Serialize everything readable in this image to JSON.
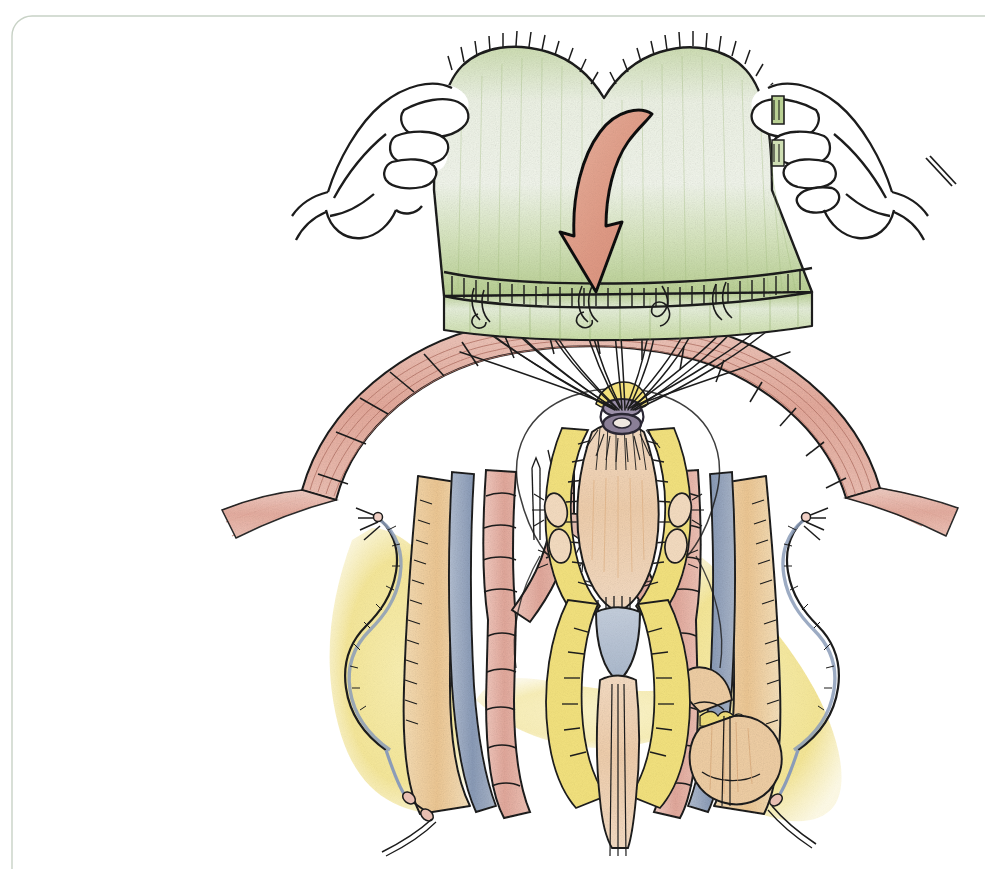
{
  "figure": {
    "domain": "Diagram",
    "kind": "hand-drawn medical surgical illustration",
    "title": "",
    "caption": "",
    "labels": [],
    "has_text": false,
    "background_color": "#ffffff",
    "canvas": {
      "width": 985,
      "height": 869
    }
  },
  "frame": {
    "style": "thin rounded-corner hairline border along top and left edges",
    "color": "#c8d2c6",
    "corner_radius": 26,
    "stroke_width": 1.4
  },
  "palette": {
    "ink": "#1a1a1a",
    "graft_green_light": "#eef3e4",
    "graft_green_mid": "#cfdfb4",
    "graft_green_deep": "#a9c383",
    "arrow_salmon": "#e09b86",
    "arrow_salmon_light": "#eab4a0",
    "artery_pink": "#e8b3a8",
    "artery_pink_deep": "#d9968a",
    "vein_blue": "#9aa9c2",
    "vein_blue_deep": "#7b8cab",
    "nerve_yellow": "#f3e27e",
    "nerve_yellow_deep": "#e8d45c",
    "fat_tan": "#f0cfa5",
    "fat_tan_deep": "#e0b584",
    "tissue_peach": "#f2d5b8",
    "suture_ring_purple": "#8a7e96",
    "skin_outline": "#222222",
    "paper_white": "#ffffff"
  },
  "scene": {
    "description": "Two gloveless hands hold a rectangular green graft patch above an open surgical field; a curved salmon arrow indicates the graft is lowered downward; long suture threads run from the graft's lower edge down to a central dark purple suture ring on the anatomical structure below.",
    "elements": [
      {
        "name": "left-hand",
        "role": "hand gripping left edge of graft"
      },
      {
        "name": "right-hand",
        "role": "hand gripping right edge of graft"
      },
      {
        "name": "green-graft-patch",
        "role": "green patch / graft material with stitched upper and lower hems"
      },
      {
        "name": "downward-arrow",
        "role": "salmon curved arrow showing direction of graft placement"
      },
      {
        "name": "suture-threads",
        "role": "fan of long sutures from graft to surgical site"
      },
      {
        "name": "suture-ring",
        "role": "dark purple ring at suture convergence point"
      },
      {
        "name": "arterial-arch",
        "role": "large pink striated arterial / muscular arch spanning the field"
      },
      {
        "name": "left-artery-branch",
        "role": "pink segmented artery branching on the left"
      },
      {
        "name": "right-artery-branch",
        "role": "pink segmented artery branching on the right"
      },
      {
        "name": "left-vein",
        "role": "blue-gray vein on the left"
      },
      {
        "name": "right-vein",
        "role": "blue-gray vein on the right"
      },
      {
        "name": "left-nerve-bundle",
        "role": "tan nerve / fat bundle at lower left"
      },
      {
        "name": "right-nerve-bundle",
        "role": "tan nerve / fat bundle at lower right"
      },
      {
        "name": "central-structure",
        "role": "central peach tissue column with yellow fatty margins and blue-gray patch"
      },
      {
        "name": "left-vessel-loop",
        "role": "vessel loop snare on left"
      },
      {
        "name": "right-vessel-loop",
        "role": "vessel loop snare on right"
      },
      {
        "name": "left-clip",
        "role": "small vascular clip on left branch"
      },
      {
        "name": "right-clip",
        "role": "small vascular clip on right branch"
      },
      {
        "name": "lower-right-node",
        "role": "rounded tan lobed node at lower right"
      },
      {
        "name": "yellow-fat-field",
        "role": "yellow fatty tissue background spreading at lower left and lower right"
      }
    ]
  }
}
